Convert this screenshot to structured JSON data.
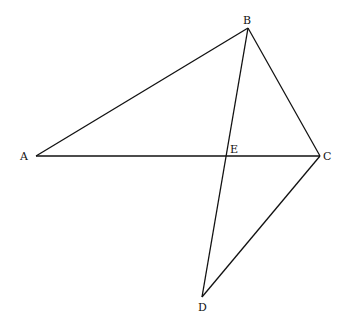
{
  "diagram": {
    "type": "geometry",
    "points": {
      "A": {
        "label": "A",
        "x": 36,
        "y": 156
      },
      "B": {
        "label": "B",
        "x": 248,
        "y": 28
      },
      "C": {
        "label": "C",
        "x": 320,
        "y": 156
      },
      "D": {
        "label": "D",
        "x": 202,
        "y": 297
      },
      "E": {
        "label": "E",
        "x": 227,
        "y": 156
      }
    },
    "segments": [
      "AB",
      "BC",
      "AC",
      "BD",
      "CD"
    ],
    "line_color": "#111111"
  }
}
